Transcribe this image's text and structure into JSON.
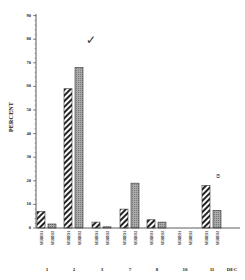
{
  "chart_data": {
    "type": "bar",
    "title": "",
    "xlabel": "",
    "ylabel": "PERCENT",
    "ylim": [
      0,
      90
    ],
    "yticks": [
      0,
      10,
      20,
      30,
      40,
      50,
      60,
      70,
      80,
      90
    ],
    "grid": false,
    "legend_position": "none (series labels printed vertically under each bar)",
    "categories": [
      "1",
      "2",
      "3",
      "7",
      "8",
      "10",
      "11"
    ],
    "trailing_axis_label": "DEC",
    "series": [
      {
        "name": "series-1 (diagonal hatched)",
        "pattern": "hatched",
        "values": [
          7,
          59,
          2.5,
          8,
          3.5,
          0,
          18
        ]
      },
      {
        "name": "series-2 (gray stippled)",
        "pattern": "gray",
        "values": [
          1.7,
          68,
          0.5,
          19,
          2.5,
          0,
          7.5
        ]
      }
    ],
    "annotations": [
      {
        "text": "checkmark",
        "near": "category 2, series-2 bar"
      },
      {
        "text": "handwritten mark",
        "near": "category 11, series-2 bar"
      }
    ]
  },
  "axis": {
    "ylabel": "PERCENT",
    "yticks": [
      "0",
      "10",
      "20",
      "30",
      "40",
      "50",
      "60",
      "70",
      "80",
      "90"
    ],
    "months": [
      "1",
      "2",
      "3",
      "7",
      "8",
      "10",
      "11",
      "DEC"
    ]
  },
  "bar_labels": {
    "series1": "SERIES1",
    "series2": "SERIES2"
  },
  "colors": {
    "axis": "#333333",
    "hatch": "#222222",
    "gray_bar": "#9a9a9a",
    "background": "#ffffff"
  }
}
